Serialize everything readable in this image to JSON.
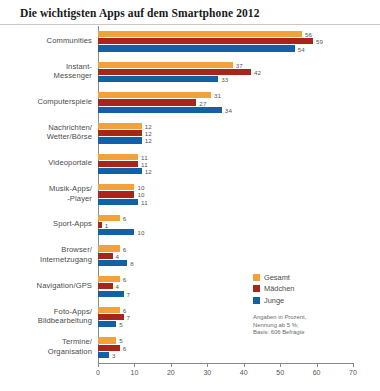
{
  "title": "Die wichtigsten Apps auf dem Smartphone 2012",
  "legend": {
    "position": "right",
    "items": [
      {
        "label": "Gesamt",
        "color": "#f3a13a",
        "key": "gesamt"
      },
      {
        "label": "Mädchen",
        "color": "#a72619",
        "key": "maedchen"
      },
      {
        "label": "Junge",
        "color": "#1460a6",
        "key": "junge"
      }
    ]
  },
  "footnote": [
    "Angaben in Prozent,",
    "Nennung ab 5 %;",
    "Basis: 606 Befragte"
  ],
  "chart_data": {
    "type": "bar",
    "orientation": "horizontal",
    "title": "Die wichtigsten Apps auf dem Smartphone 2012",
    "xlabel": "",
    "ylabel": "",
    "xlim": [
      0,
      70
    ],
    "xticks": [
      0,
      10,
      20,
      30,
      40,
      50,
      60,
      70
    ],
    "grid": false,
    "legend_position": "right",
    "categories": [
      "Communities",
      "Instant-\nMessenger",
      "Computerspiele",
      "Nachrichten/\nWetter/Börse",
      "Videoportale",
      "Musik-Apps/\n-Player",
      "Sport-Apps",
      "Browser/\nInternetzugang",
      "Navigation/GPS",
      "Foto-Apps/\nBildbearbeitung",
      "Termine/\nOrganisation"
    ],
    "category_lines": [
      [
        "Communities"
      ],
      [
        "Instant-",
        "Messenger"
      ],
      [
        "Computerspiele"
      ],
      [
        "Nachrichten/",
        "Wetter/Börse"
      ],
      [
        "Videoportale"
      ],
      [
        "Musik-Apps/",
        "-Player"
      ],
      [
        "Sport-Apps"
      ],
      [
        "Browser/",
        "Internetzugang"
      ],
      [
        "Navigation/GPS"
      ],
      [
        "Foto-Apps/",
        "Bildbearbeitung"
      ],
      [
        "Termine/",
        "Organisation"
      ]
    ],
    "series": [
      {
        "name": "Gesamt",
        "color": "#f3a13a",
        "values": [
          56,
          37,
          31,
          12,
          11,
          10,
          6,
          6,
          6,
          6,
          5
        ]
      },
      {
        "name": "Mädchen",
        "color": "#a72619",
        "values": [
          59,
          42,
          27,
          12,
          11,
          10,
          1,
          4,
          4,
          7,
          6
        ]
      },
      {
        "name": "Junge",
        "color": "#1460a6",
        "values": [
          54,
          33,
          34,
          12,
          12,
          11,
          10,
          8,
          7,
          5,
          3
        ]
      }
    ],
    "units": "percent",
    "note": "Angaben in Prozent, Nennung ab 5 %; Basis: 606 Befragte"
  }
}
